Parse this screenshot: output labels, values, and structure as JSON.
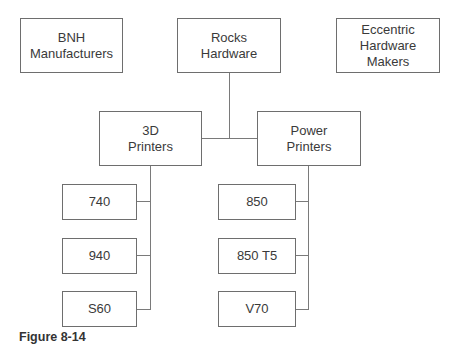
{
  "diagram": {
    "top_level": [
      {
        "line1": "BNH",
        "line2": "Manufacturers"
      },
      {
        "line1": "Rocks",
        "line2": "Hardware"
      },
      {
        "line1": "Eccentric",
        "line2": "Hardware Makers"
      }
    ],
    "categories": [
      {
        "line1": "3D",
        "line2": "Printers",
        "items": [
          "740",
          "940",
          "S60"
        ]
      },
      {
        "line1": "Power",
        "line2": "Printers",
        "items": [
          "850",
          "850 T5",
          "V70"
        ]
      }
    ]
  },
  "caption": "Figure 8-14"
}
